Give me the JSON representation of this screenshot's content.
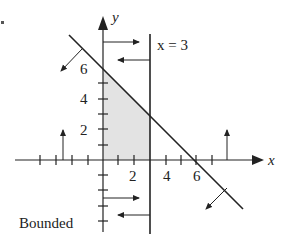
{
  "diagram": {
    "title": "",
    "axes": {
      "x_label": "x",
      "y_label": "y",
      "x_tick_labels": [
        "2",
        "4",
        "6"
      ],
      "y_tick_labels": [
        "2",
        "4",
        "6"
      ]
    },
    "lines": [
      {
        "name": "x + y = 6",
        "equation": "x + y = 6"
      },
      {
        "name": "x = 3",
        "label": "x = 3"
      }
    ],
    "shaded_region": {
      "description": "Triangle-like region bounded by x >= 0, y >= 0, x <= 3, x + y <= 6",
      "vertices": [
        [
          0,
          0
        ],
        [
          0,
          6
        ],
        [
          3,
          3
        ],
        [
          3,
          0
        ]
      ],
      "fill": "#e3e3e3"
    },
    "annotation": "Bounded",
    "colors": {
      "ink": "#222222",
      "shade": "#e3e3e3"
    }
  }
}
